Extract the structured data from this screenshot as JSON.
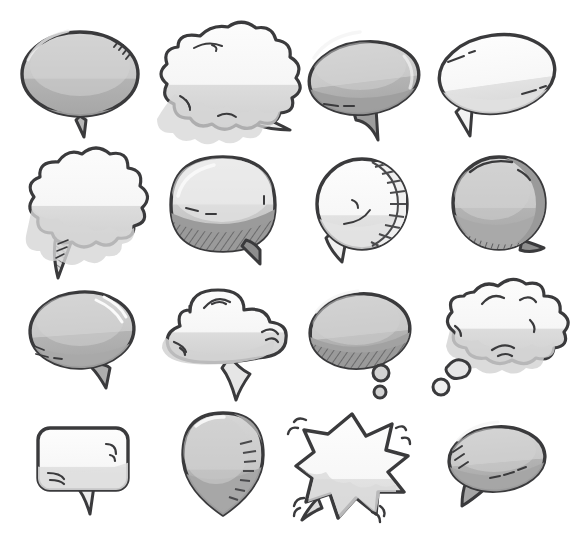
{
  "page": {
    "background_color": "#ffffff",
    "width": 572,
    "height": 543,
    "columns": 4,
    "rows": 4,
    "total_bubbles": 16
  },
  "palette": {
    "outline": "#3a3a3c",
    "outline_soft": "#555557",
    "white_fill": "#fbfbfb",
    "light_gray": "#e8e8e8",
    "mid_gray": "#c9c9c9",
    "gray": "#b8b8b8",
    "dark_gray": "#a0a0a0",
    "shadow_gray": "#8f8f8f",
    "hatch_gray": "#6e6e70",
    "background": "#ffffff"
  },
  "bubbles": [
    {
      "index": 1,
      "row": 1,
      "col": 1,
      "name": "oval-speech-bubble-gray",
      "shape": "oval",
      "tail": "bottom-center-spike",
      "fill": "mid_gray",
      "shading": "bottom-band",
      "accents": "corner-speed-lines-top-right",
      "cx": 80,
      "cy": 74,
      "rx": 58,
      "ry": 42
    },
    {
      "index": 2,
      "row": 1,
      "col": 2,
      "name": "cloud-speech-bubble-white",
      "shape": "cloud",
      "tail": "bottom-right-flat-tail",
      "fill": "white_fill",
      "shading": "bottom-cloud-shadow",
      "accents": "ink-squiggles",
      "cx": 222,
      "cy": 80,
      "rx": 55,
      "ry": 48
    },
    {
      "index": 3,
      "row": 1,
      "col": 3,
      "name": "tilted-oval-speech-bubble-gray",
      "shape": "oval-tilted",
      "tail": "bottom-right-hook-tail",
      "fill": "gray",
      "shading": "heavy-bottom",
      "accents": "dash-marks-bottom",
      "cx": 364,
      "cy": 78,
      "rx": 55,
      "ry": 36
    },
    {
      "index": 4,
      "row": 1,
      "col": 4,
      "name": "tilted-oval-speech-bubble-white",
      "shape": "oval-tilted",
      "tail": "bottom-left-spike",
      "fill": "white_fill",
      "shading": "light-bottom",
      "accents": "highlight-dashes",
      "cx": 497,
      "cy": 74,
      "rx": 58,
      "ry": 39
    },
    {
      "index": 5,
      "row": 2,
      "col": 1,
      "name": "cloud-speech-bubble-scalloped",
      "shape": "cloud-scalloped",
      "tail": "bottom-left-hatched-tail",
      "fill": "white_fill",
      "shading": "bottom-gray-band",
      "accents": "hatched-tail",
      "cx": 82,
      "cy": 200,
      "rx": 53,
      "ry": 45
    },
    {
      "index": 6,
      "row": 2,
      "col": 2,
      "name": "rounded-square-bubble-hatched",
      "shape": "rounded-dome",
      "tail": "bottom-right-wedge",
      "fill": "light_gray",
      "shading": "deep-hatched-base",
      "accents": "diagonal-hatching",
      "cx": 223,
      "cy": 205,
      "rx": 55,
      "ry": 45
    },
    {
      "index": 7,
      "row": 2,
      "col": 3,
      "name": "circle-speech-bubble-ribbed",
      "shape": "circle",
      "tail": "bottom-left-wedge",
      "fill": "white_fill",
      "shading": "ribbed-right-edge",
      "accents": "ladder-hatch-right",
      "cx": 362,
      "cy": 204,
      "rx": 45,
      "ry": 45
    },
    {
      "index": 8,
      "row": 2,
      "col": 4,
      "name": "circle-speech-bubble-gray-ribbed",
      "shape": "circle",
      "tail": "bottom-right-wedge",
      "fill": "mid_gray",
      "shading": "dark-right-crescent",
      "accents": "hatch-bottom-left",
      "cx": 499,
      "cy": 203,
      "rx": 46,
      "ry": 46
    },
    {
      "index": 9,
      "row": 3,
      "col": 1,
      "name": "oval-speech-bubble-gray-small-tail",
      "shape": "oval",
      "tail": "bottom-right-small-spike",
      "fill": "mid_gray",
      "shading": "bottom-band",
      "accents": "highlight-streak-top-right",
      "cx": 82,
      "cy": 330,
      "rx": 52,
      "ry": 38
    },
    {
      "index": 10,
      "row": 3,
      "col": 2,
      "name": "cloud-bubble-three-lobes",
      "shape": "cloud-three-lobe",
      "tail": "bottom-center-wedge",
      "fill": "white_fill",
      "shading": "bottom-gray-band",
      "accents": "ink-swoops",
      "cx": 222,
      "cy": 330,
      "rx": 56,
      "ry": 39
    },
    {
      "index": 11,
      "row": 3,
      "col": 3,
      "name": "thought-bubble-oval-gray",
      "shape": "oval",
      "tail": "two-thought-dots-bottom-right",
      "fill": "mid_gray",
      "shading": "hatched-bottom",
      "accents": "diagonal-hatching",
      "cx": 360,
      "cy": 331,
      "rx": 50,
      "ry": 37
    },
    {
      "index": 12,
      "row": 3,
      "col": 4,
      "name": "thought-bubble-cloud-white",
      "shape": "cloud",
      "tail": "two-thought-dots-bottom-left",
      "fill": "white_fill",
      "shading": "bottom-cloud-shadow",
      "accents": "ink-swoops",
      "cx": 497,
      "cy": 328,
      "rx": 53,
      "ry": 41
    },
    {
      "index": 13,
      "row": 4,
      "col": 1,
      "name": "rounded-rect-speech-bubble-white",
      "shape": "rounded-rectangle",
      "tail": "bottom-center-spike",
      "fill": "white_fill",
      "shading": "bottom-gray-band",
      "accents": "corner-shine-marks",
      "cx": 83,
      "cy": 459,
      "rx": 45,
      "ry": 31
    },
    {
      "index": 14,
      "row": 4,
      "col": 2,
      "name": "teardrop-speech-bubble-gray",
      "shape": "teardrop",
      "tail": "bottom-point",
      "fill": "mid_gray",
      "shading": "dark-bottom-right",
      "accents": "ladder-hatch-right",
      "cx": 223,
      "cy": 457,
      "rx": 38,
      "ry": 44
    },
    {
      "index": 15,
      "row": 4,
      "col": 3,
      "name": "starburst-shout-bubble-white",
      "shape": "starburst",
      "tail": "bottom-left-spike",
      "fill": "white_fill",
      "shading": "bottom-gray-shadow",
      "accents": "impact-motion-lines",
      "cx": 352,
      "cy": 461,
      "rx": 55,
      "ry": 48
    },
    {
      "index": 16,
      "row": 4,
      "col": 4,
      "name": "oval-speech-bubble-gray-left-tail",
      "shape": "oval",
      "tail": "bottom-left-wedge",
      "fill": "mid_gray",
      "shading": "bottom-band",
      "accents": "hatch-left-dashes-bottom",
      "cx": 497,
      "cy": 459,
      "rx": 48,
      "ry": 32
    }
  ]
}
